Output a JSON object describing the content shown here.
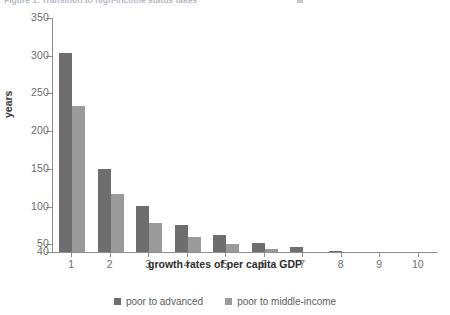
{
  "figure": {
    "title_fragment": "Figure 1. Transition to high-income status takes",
    "ylabel": "years",
    "xlabel": "growth rates of per capita GDP"
  },
  "legend": {
    "items": [
      {
        "label": "poor to advanced",
        "color": "#6e6e6e"
      },
      {
        "label": "poor to middle-income",
        "color": "#9a9a9a"
      }
    ]
  },
  "yaxis": {
    "ticks": [
      "350",
      "300",
      "250",
      "200",
      "150",
      "100",
      "50",
      "40"
    ]
  },
  "chart_data": {
    "type": "bar",
    "title": "Figure 1. Transition to high-income status takes",
    "xlabel": "growth rates of per capita GDP",
    "ylabel": "years",
    "categories": [
      "1",
      "2",
      "3",
      "4",
      "5",
      "6",
      "7",
      "8",
      "9",
      "10"
    ],
    "ylim": [
      40,
      350
    ],
    "yticks": [
      40,
      50,
      100,
      150,
      200,
      250,
      300,
      350
    ],
    "grid": false,
    "legend_position": "bottom-center",
    "series": [
      {
        "name": "poor to advanced",
        "color": "#6e6e6e",
        "values": [
          303,
          150,
          101,
          76,
          62,
          52,
          46,
          42,
          38,
          37
        ]
      },
      {
        "name": "poor to middle-income",
        "color": "#9a9a9a",
        "values": [
          233,
          117,
          78,
          60,
          51,
          44,
          38,
          35,
          34,
          32
        ]
      }
    ]
  }
}
